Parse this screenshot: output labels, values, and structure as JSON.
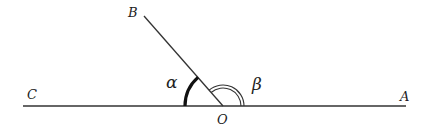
{
  "diagram": {
    "points": {
      "O": {
        "label": "O",
        "x": 223,
        "y": 106
      },
      "A": {
        "label": "A",
        "x": 405,
        "y": 106
      },
      "C": {
        "label": "C",
        "x": 23,
        "y": 106
      },
      "B": {
        "label": "B",
        "x": 144,
        "y": 16
      }
    },
    "angles": {
      "alpha": {
        "label": "α",
        "between": [
          "OB",
          "OC"
        ],
        "style": "thick single arc"
      },
      "beta": {
        "label": "β",
        "between": [
          "OA",
          "OB"
        ],
        "style": "double arc"
      }
    },
    "colors": {
      "line": "#333333",
      "text": "#222222"
    }
  }
}
